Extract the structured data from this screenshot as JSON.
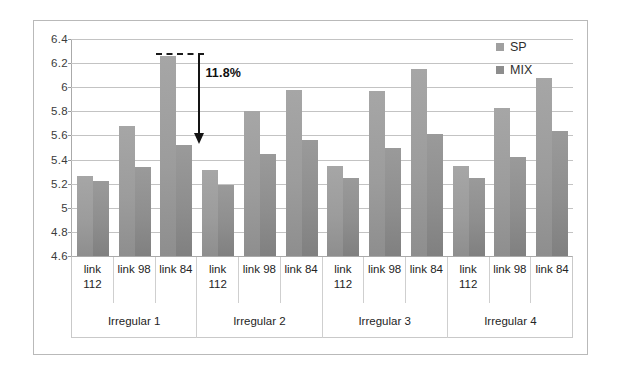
{
  "chart_data": {
    "type": "bar",
    "title": "",
    "xlabel": "",
    "ylabel": "",
    "ylim": [
      4.6,
      6.4
    ],
    "ytick_step": 0.2,
    "grid": true,
    "legend_position": "top-right",
    "categories": [
      "link 112",
      "link 98",
      "link 84",
      "link 112",
      "link 98",
      "link 84",
      "link 112",
      "link 98",
      "link 84",
      "link 112",
      "link 98",
      "link 84"
    ],
    "groups": [
      "Irregular 1",
      "Irregular 2",
      "Irregular 3",
      "Irregular 4"
    ],
    "ytick_labels": [
      "6.4",
      "6.2",
      "6",
      "5.8",
      "5.6",
      "5.4",
      "5.2",
      "5",
      "4.8",
      "4.6"
    ],
    "ytick_values": [
      6.4,
      6.2,
      6.0,
      5.8,
      5.6,
      5.4,
      5.2,
      5.0,
      4.8,
      4.6
    ],
    "series": [
      {
        "name": "SP",
        "color": "#a0a0a0",
        "values": [
          5.26,
          5.68,
          6.26,
          5.31,
          5.8,
          5.98,
          5.35,
          5.97,
          6.15,
          5.35,
          5.83,
          6.08
        ]
      },
      {
        "name": "MIX",
        "color": "#8d8d8d",
        "values": [
          5.22,
          5.34,
          5.52,
          5.19,
          5.45,
          5.56,
          5.25,
          5.5,
          5.61,
          5.25,
          5.42,
          5.64
        ]
      }
    ],
    "annotations": [
      {
        "name": "gap-callout",
        "label": "11.8%",
        "from_value": 6.26,
        "to_value": 5.52,
        "target_category_index": 2,
        "style": "dashed-line-with-down-arrow"
      }
    ]
  },
  "legend": {
    "items": [
      {
        "label": "SP",
        "swatch": "legend-swatch-sp"
      },
      {
        "label": "MIX",
        "swatch": "legend-swatch-mix"
      }
    ]
  },
  "tick_labels": [
    "link\n112",
    "link 98",
    "link 84",
    "link\n112",
    "link 98",
    "link 84",
    "link\n112",
    "link 98",
    "link 84",
    "link\n112",
    "link 98",
    "link 84"
  ]
}
